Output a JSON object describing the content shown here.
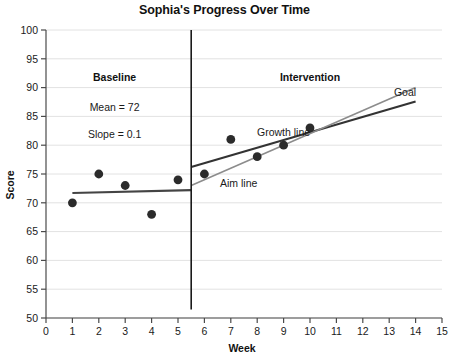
{
  "chart_data": {
    "type": "scatter",
    "title": "Sophia's Progress Over Time",
    "xlabel": "Week",
    "ylabel": "Score",
    "xlim": [
      0,
      15
    ],
    "ylim": [
      50,
      100
    ],
    "xticks": [
      "0",
      "1",
      "2",
      "3",
      "4",
      "5",
      "6",
      "7",
      "8",
      "9",
      "10",
      "11",
      "12",
      "13",
      "14",
      "15"
    ],
    "yticks": [
      "50",
      "55",
      "60",
      "65",
      "70",
      "75",
      "80",
      "85",
      "90",
      "95",
      "100"
    ],
    "grid": true,
    "legend": "none",
    "x": [
      1,
      2,
      3,
      4,
      5,
      6,
      7,
      8,
      9,
      10
    ],
    "values": [
      70,
      75,
      73,
      68,
      74,
      75,
      81,
      78,
      80,
      83
    ],
    "series": [
      {
        "name": "Baseline data",
        "x": [
          1,
          2,
          3,
          4,
          5
        ],
        "values": [
          70,
          75,
          73,
          68,
          74
        ]
      },
      {
        "name": "Intervention data",
        "x": [
          6,
          7,
          8,
          9,
          10
        ],
        "values": [
          75,
          81,
          78,
          80,
          83
        ]
      }
    ],
    "trend_lines": [
      {
        "name": "Baseline trend line",
        "x": [
          1,
          5.5
        ],
        "y": [
          71.7,
          72.2
        ],
        "color": "#444444"
      },
      {
        "name": "Growth line",
        "x": [
          5.5,
          14
        ],
        "y": [
          76.2,
          87.6
        ],
        "color": "#333333"
      },
      {
        "name": "Aim line",
        "x": [
          5.5,
          14
        ],
        "y": [
          73.0,
          90.0
        ],
        "color": "#8c8c8c"
      }
    ],
    "phase_line": {
      "name": "Phase change line",
      "x": 5.5,
      "y_top": 100,
      "y_bottom": 51.5
    },
    "annotations": [
      {
        "name": "baseline-phase-heading",
        "text": "Baseline",
        "x": 2.6,
        "y": 91.2
      },
      {
        "name": "baseline-mean",
        "text": "Mean = 72",
        "x": 2.6,
        "y": 86.0
      },
      {
        "name": "baseline-slope",
        "text": "Slope = 0.1",
        "x": 2.6,
        "y": 81.2
      },
      {
        "name": "intervention-phase-heading",
        "text": "Intervention",
        "x": 10.0,
        "y": 91.2
      },
      {
        "name": "goal-label",
        "text": "Goal",
        "x": 13.6,
        "y": 88.6
      },
      {
        "name": "growth-line-label",
        "text": "Growth line",
        "x": 9.0,
        "y": 81.6
      },
      {
        "name": "aim-line-label",
        "text": "Aim line",
        "x": 7.3,
        "y": 72.8
      }
    ]
  },
  "colors": {
    "point": "#2b2b2b",
    "grid": "#e2e2e2",
    "axis": "#4a4a4a",
    "phase_line": "#1a1a1a",
    "aim_line": "#8c8c8c",
    "growth_line": "#333333",
    "baseline_trend": "#444444",
    "title": "#111111"
  }
}
